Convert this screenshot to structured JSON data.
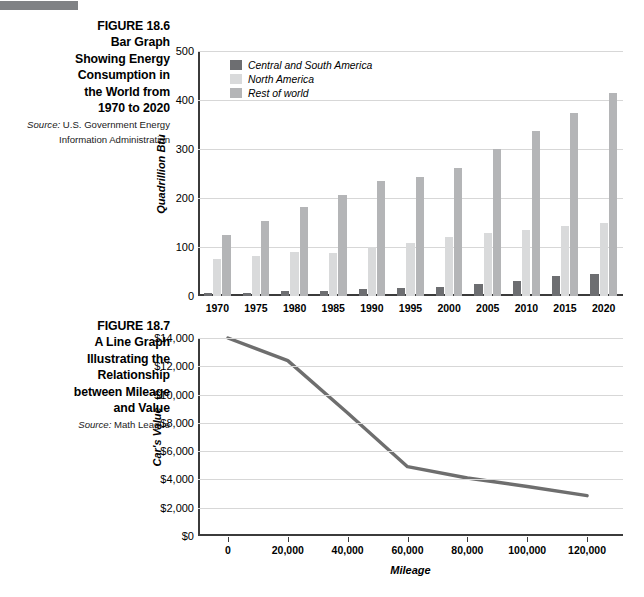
{
  "page": {
    "rule_color": "#808285"
  },
  "figures": [
    {
      "id": "figure-186",
      "caption_title": "FIGURE 18.6 Bar Graph Showing Energy Consumption in the World from 1970 to 2020",
      "caption_lines": [
        "FIGURE 18.6",
        "Bar Graph",
        "Showing Energy",
        "Consumption in",
        "the World from",
        "1970 to 2020"
      ],
      "source_label": "Source:",
      "source_text": " U.S. Government Energy Information Administration"
    },
    {
      "id": "figure-187",
      "caption_title": "FIGURE 18.7 A Line Graph Illustrating the Relationship between Mileage and Value",
      "caption_lines": [
        "FIGURE 18.7",
        "A Line Graph",
        "Illustrating the",
        "Relationship",
        "between Mileage",
        "and Value"
      ],
      "source_label": "Source:",
      "source_text": " Math League"
    }
  ],
  "chart_data": [
    {
      "type": "bar",
      "title": "Bar Graph Showing Energy Consumption in the World from 1970 to 2020",
      "xlabel": "",
      "ylabel": "Quadrillion Btu",
      "categories": [
        "1970",
        "1975",
        "1980",
        "1985",
        "1990",
        "1995",
        "2000",
        "2005",
        "2010",
        "2015",
        "2020"
      ],
      "series": [
        {
          "name": "Central and South America",
          "color": "#6d6e71",
          "values": [
            7,
            7,
            11,
            11,
            14,
            16,
            19,
            25,
            30,
            40,
            45
          ]
        },
        {
          "name": "North America",
          "color": "#d9dadb",
          "values": [
            76,
            82,
            90,
            88,
            100,
            108,
            120,
            128,
            135,
            143,
            150
          ]
        },
        {
          "name": "Rest of world",
          "color": "#b4b5b7",
          "values": [
            124,
            153,
            182,
            206,
            235,
            243,
            261,
            301,
            336,
            374,
            415
          ]
        }
      ],
      "ylim": [
        0,
        500
      ],
      "yticks": [
        0,
        100,
        200,
        300,
        400,
        500
      ],
      "ytick_labels": [
        "0",
        "100",
        "200",
        "300",
        "400",
        "500"
      ],
      "grid": true,
      "legend_position": "top-left"
    },
    {
      "type": "line",
      "title": "A Line Graph Illustrating the Relationship between Mileage and Value",
      "xlabel": "Mileage",
      "ylabel": "Car's Value",
      "x": [
        0,
        20000,
        40000,
        60000,
        80000,
        100000,
        120000
      ],
      "xtick_labels": [
        "0",
        "20,000",
        "40,000",
        "60,000",
        "80,000",
        "100,000",
        "120,000"
      ],
      "xlim": [
        -10000,
        132000
      ],
      "values": [
        14000,
        12400,
        8700,
        4900,
        4100,
        3500,
        2850
      ],
      "line_color": "#6e6e6e",
      "ylim": [
        0,
        14000
      ],
      "yticks": [
        0,
        2000,
        4000,
        6000,
        8000,
        10000,
        12000,
        14000
      ],
      "ytick_labels": [
        "$0",
        "$2,000",
        "$4,000",
        "$6,000",
        "$8,000",
        "$10,000",
        "$12,000",
        "$14,000"
      ],
      "grid": true,
      "legend_position": "none"
    }
  ]
}
